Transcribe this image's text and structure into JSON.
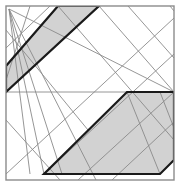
{
  "figure": {
    "type": "line-arrangement",
    "width": 180,
    "height": 186,
    "background_color": "#ffffff",
    "colors": {
      "background": "#ffffff",
      "frame_stroke": "#8c8c8c",
      "thin_line": "#8a8a8a",
      "thick_line": "#1a1a1a",
      "band_fill": "#d2d2d2",
      "band_fill_dark": "#c4c4c4"
    },
    "frame": {
      "name": "outer-square-frame",
      "x": 6,
      "y": 6,
      "width": 168,
      "height": 174,
      "stroke_width": 1.4
    },
    "bands": [
      {
        "name": "upper-left-band",
        "fill": "#d2d2d2",
        "stroke_width": 2.2,
        "points": "6,66 58,6 99,6 6,92"
      },
      {
        "name": "lower-right-band",
        "fill": "#d2d2d2",
        "stroke_width": 2.2,
        "points": "127,92 174,92 174,160 160,174 44,174"
      }
    ],
    "thin_lines": [
      {
        "name": "horizontal-midline",
        "x1": 6,
        "y1": 92,
        "x2": 174,
        "y2": 92
      },
      {
        "name": "fan-line-1",
        "x1": 9,
        "y1": 9,
        "x2": 44,
        "y2": 174
      },
      {
        "name": "fan-line-2",
        "x1": 9,
        "y1": 9,
        "x2": 30,
        "y2": 174
      },
      {
        "name": "fan-line-3",
        "x1": 9,
        "y1": 9,
        "x2": 62,
        "y2": 174
      },
      {
        "name": "fan-line-4",
        "x1": 9,
        "y1": 9,
        "x2": 96,
        "y2": 180
      },
      {
        "name": "fan-line-5",
        "x1": 9,
        "y1": 9,
        "x2": 174,
        "y2": 92
      },
      {
        "name": "diagonal-up-1",
        "x1": 6,
        "y1": 92,
        "x2": 99,
        "y2": 6
      },
      {
        "name": "diagonal-up-2",
        "x1": 6,
        "y1": 174,
        "x2": 174,
        "y2": 18
      },
      {
        "name": "diagonal-up-3",
        "x1": 44,
        "y1": 174,
        "x2": 174,
        "y2": 54
      },
      {
        "name": "diagonal-up-4",
        "x1": 78,
        "y1": 180,
        "x2": 174,
        "y2": 92
      },
      {
        "name": "diagonal-up-5",
        "x1": 112,
        "y1": 180,
        "x2": 174,
        "y2": 122
      },
      {
        "name": "diagonal-up-6",
        "x1": 6,
        "y1": 48,
        "x2": 50,
        "y2": 6
      },
      {
        "name": "diagonal-down-1",
        "x1": 58,
        "y1": 6,
        "x2": 174,
        "y2": 140
      },
      {
        "name": "diagonal-down-2",
        "x1": 99,
        "y1": 6,
        "x2": 174,
        "y2": 92
      },
      {
        "name": "diagonal-down-3",
        "x1": 128,
        "y1": 6,
        "x2": 174,
        "y2": 58
      },
      {
        "name": "diagonal-down-4",
        "x1": 170,
        "y1": 6,
        "x2": 174,
        "y2": 11
      },
      {
        "name": "diagonal-down-5",
        "x1": 6,
        "y1": 30,
        "x2": 88,
        "y2": 130
      },
      {
        "name": "diagonal-down-6",
        "x1": 6,
        "y1": 120,
        "x2": 60,
        "y2": 180
      },
      {
        "name": "band-interior-1",
        "x1": 30,
        "y1": 6,
        "x2": 6,
        "y2": 80
      },
      {
        "name": "band-interior-2",
        "x1": 127,
        "y1": 92,
        "x2": 160,
        "y2": 174
      },
      {
        "name": "band-interior-3",
        "x1": 160,
        "y1": 92,
        "x2": 174,
        "y2": 128
      }
    ]
  }
}
